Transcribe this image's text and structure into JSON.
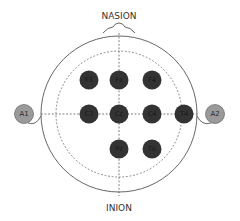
{
  "diagram": {
    "labels": {
      "top": "NASION",
      "bottom": "INION"
    },
    "colors": {
      "electrode_fill": "#333333",
      "reference_fill": "#9a9a9a",
      "outline": "#555555",
      "dashed": "#666666"
    },
    "electrodes": [
      {
        "id": "F3",
        "label": "F3",
        "x": 89,
        "y": 80
      },
      {
        "id": "Fz",
        "label": "Fz",
        "x": 119,
        "y": 80
      },
      {
        "id": "F4",
        "label": "F4",
        "x": 152,
        "y": 80
      },
      {
        "id": "C3",
        "label": "C3",
        "x": 89,
        "y": 114
      },
      {
        "id": "Cz",
        "label": "Cz",
        "x": 119,
        "y": 114
      },
      {
        "id": "C4",
        "label": "C4",
        "x": 152,
        "y": 114
      },
      {
        "id": "T4",
        "label": "T4",
        "x": 184,
        "y": 114
      },
      {
        "id": "Pz",
        "label": "Pz",
        "x": 119,
        "y": 149
      },
      {
        "id": "T6",
        "label": "T6",
        "x": 152,
        "y": 149
      }
    ],
    "references": [
      {
        "id": "A1",
        "label": "A1",
        "x": 24,
        "y": 114
      },
      {
        "id": "A2",
        "label": "A2",
        "x": 215,
        "y": 114
      }
    ]
  }
}
